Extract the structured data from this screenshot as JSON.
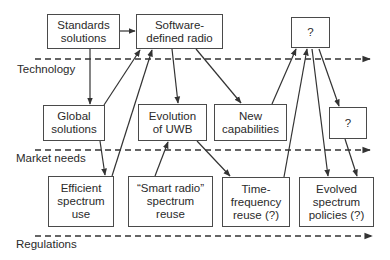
{
  "diagram": {
    "lanes": [
      {
        "id": "technology",
        "label": "Technology",
        "line_y": 59
      },
      {
        "id": "market",
        "label": "Market needs",
        "line_y": 150
      },
      {
        "id": "regulations",
        "label": "Regulations",
        "line_y": 236
      }
    ],
    "nodes": {
      "standards": {
        "label": "Standards\nsolutions"
      },
      "sdr": {
        "label": "Software-\ndefined radio"
      },
      "unknown_top": {
        "label": "?"
      },
      "global": {
        "label": "Global\nsolutions"
      },
      "uwb": {
        "label": "Evolution\nof UWB"
      },
      "new_cap": {
        "label": "New\ncapabilities"
      },
      "unknown_mid": {
        "label": "?"
      },
      "efficient": {
        "label": "Efficient\nspectrum\nuse"
      },
      "smart_radio": {
        "label": "“Smart radio”\nspectrum\nreuse"
      },
      "time_freq": {
        "label": "Time-\nfrequency\nreuse (?)"
      },
      "evolved": {
        "label": "Evolved\nspectrum\npolicies (?)"
      }
    },
    "edges": [
      {
        "from": "standards",
        "to": "sdr"
      },
      {
        "from": "standards",
        "to": "global"
      },
      {
        "from": "global",
        "to": "sdr"
      },
      {
        "from": "global",
        "to": "efficient"
      },
      {
        "from": "efficient",
        "to": "sdr"
      },
      {
        "from": "sdr",
        "to": "uwb"
      },
      {
        "from": "sdr",
        "to": "new_cap"
      },
      {
        "from": "smart_radio",
        "to": "uwb"
      },
      {
        "from": "uwb",
        "to": "time_freq"
      },
      {
        "from": "new_cap",
        "to": "unknown_top"
      },
      {
        "from": "time_freq",
        "to": "unknown_top"
      },
      {
        "from": "unknown_top",
        "to": "evolved"
      },
      {
        "from": "unknown_top",
        "to": "unknown_mid"
      },
      {
        "from": "unknown_mid",
        "to": "evolved"
      }
    ],
    "colors": {
      "stroke": "#333333",
      "box_border": "#4a4a4a",
      "text": "#2a2a2a"
    }
  }
}
